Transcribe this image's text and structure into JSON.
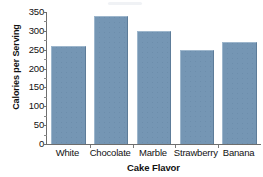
{
  "chart_data": {
    "type": "bar",
    "title": "",
    "xlabel": "Cake Flavor",
    "ylabel": "Calories per Serving",
    "categories": [
      "White",
      "Chocolate",
      "Marble",
      "Strawberry",
      "Banana"
    ],
    "values": [
      260,
      340,
      300,
      250,
      270
    ],
    "ylim": [
      0,
      350
    ],
    "ytick_labels": [
      "350",
      "300",
      "250",
      "200",
      "150",
      "100",
      "50",
      "0"
    ],
    "ytick_values": [
      350,
      300,
      250,
      200,
      150,
      100,
      50,
      0
    ],
    "ytick_step": 50,
    "grid": false,
    "legend": false,
    "series": [
      {
        "name": "Calories per Serving",
        "values": [
          260,
          340,
          300,
          250,
          270
        ],
        "color": "#7596b4"
      }
    ],
    "bar_color": "#7596b4",
    "bar_edge_light": "#9db6cc",
    "bar_edge_dark": "#5d7c99",
    "axis_color": "#6e6e6e",
    "background": "#ffffff"
  }
}
